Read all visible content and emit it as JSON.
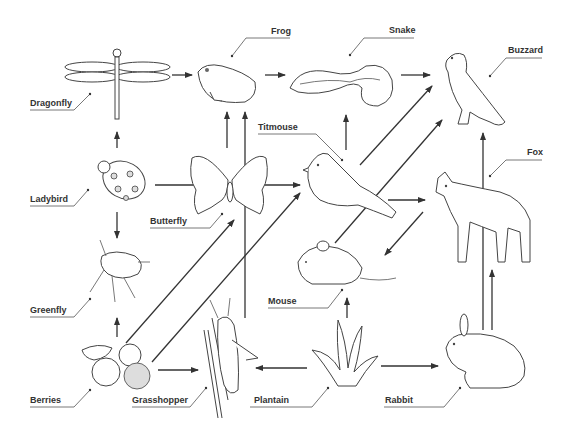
{
  "diagram": {
    "type": "food-web",
    "organisms": {
      "dragonfly": "Dragonfly",
      "frog": "Frog",
      "snake": "Snake",
      "buzzard": "Buzzard",
      "ladybird": "Ladybird",
      "butterfly": "Butterfly",
      "titmouse": "Titmouse",
      "fox": "Fox",
      "greenfly": "Greenfly",
      "mouse": "Mouse",
      "berries": "Berries",
      "grasshopper": "Grasshopper",
      "plantain": "Plantain",
      "rabbit": "Rabbit"
    },
    "edges": [
      {
        "from": "Dragonfly",
        "to": "Frog"
      },
      {
        "from": "Frog",
        "to": "Snake"
      },
      {
        "from": "Snake",
        "to": "Buzzard"
      },
      {
        "from": "Ladybird",
        "to": "Dragonfly"
      },
      {
        "from": "Ladybird",
        "to": "Greenfly"
      },
      {
        "from": "Ladybird",
        "to": "Titmouse"
      },
      {
        "from": "Butterfly",
        "to": "Frog"
      },
      {
        "from": "Grasshopper",
        "to": "Frog"
      },
      {
        "from": "Titmouse",
        "to": "Snake"
      },
      {
        "from": "Titmouse",
        "to": "Buzzard"
      },
      {
        "from": "Titmouse",
        "to": "Fox"
      },
      {
        "from": "Mouse",
        "to": "Buzzard"
      },
      {
        "from": "Fox",
        "to": "Mouse"
      },
      {
        "from": "Rabbit",
        "to": "Buzzard"
      },
      {
        "from": "Rabbit",
        "to": "Fox"
      },
      {
        "from": "Berries",
        "to": "Greenfly"
      },
      {
        "from": "Berries",
        "to": "Butterfly"
      },
      {
        "from": "Berries",
        "to": "Titmouse"
      },
      {
        "from": "Berries",
        "to": "Grasshopper"
      },
      {
        "from": "Plantain",
        "to": "Grasshopper"
      },
      {
        "from": "Plantain",
        "to": "Mouse"
      },
      {
        "from": "Plantain",
        "to": "Rabbit"
      }
    ]
  }
}
